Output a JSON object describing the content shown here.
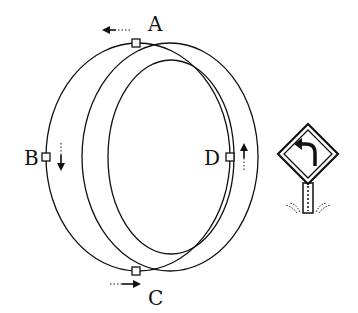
{
  "diagram": {
    "points": [
      {
        "id": "A",
        "label": "A",
        "arrow": "left"
      },
      {
        "id": "B",
        "label": "B",
        "arrow": "down"
      },
      {
        "id": "C",
        "label": "C",
        "arrow": "right"
      },
      {
        "id": "D",
        "label": "D",
        "arrow": "up"
      }
    ],
    "sign": {
      "icon": "left-turn-road-sign-icon"
    },
    "colors": {
      "stroke": "#111111",
      "background": "#ffffff"
    }
  }
}
